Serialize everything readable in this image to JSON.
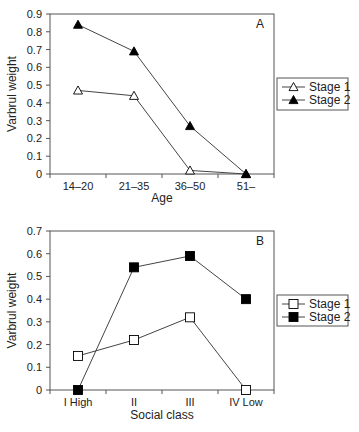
{
  "chart_data": [
    {
      "type": "line",
      "panel_label": "A",
      "title": "",
      "xlabel": "Age",
      "ylabel": "Varbrul weight",
      "categories": [
        "14–20",
        "21–35",
        "36–50",
        "51–"
      ],
      "ylim": [
        0,
        0.9
      ],
      "yticks": [
        "0",
        "0.1",
        "0.2",
        "0.3",
        "0.4",
        "0.5",
        "0.6",
        "0.7",
        "0.8",
        "0.9"
      ],
      "grid": false,
      "legend_position": "right",
      "series": [
        {
          "name": "Stage 1",
          "marker": "open-triangle",
          "values": [
            0.47,
            0.44,
            0.02,
            0.0
          ]
        },
        {
          "name": "Stage 2",
          "marker": "filled-triangle",
          "values": [
            0.84,
            0.69,
            0.27,
            0.0
          ]
        }
      ]
    },
    {
      "type": "line",
      "panel_label": "B",
      "title": "",
      "xlabel": "Social class",
      "ylabel": "Varbrul weight",
      "categories": [
        "I High",
        "II",
        "III",
        "IV Low"
      ],
      "ylim": [
        0,
        0.7
      ],
      "yticks": [
        "0",
        "0.1",
        "0.2",
        "0.3",
        "0.4",
        "0.5",
        "0.6",
        "0.7"
      ],
      "grid": false,
      "legend_position": "right",
      "series": [
        {
          "name": "Stage 1",
          "marker": "open-square",
          "values": [
            0.15,
            0.22,
            0.32,
            0.0
          ]
        },
        {
          "name": "Stage 2",
          "marker": "filled-square",
          "values": [
            0.0,
            0.54,
            0.59,
            0.4
          ]
        }
      ]
    }
  ],
  "colors": {
    "line": "#444444",
    "marker_fill": "#000000",
    "axis": "#555555"
  }
}
